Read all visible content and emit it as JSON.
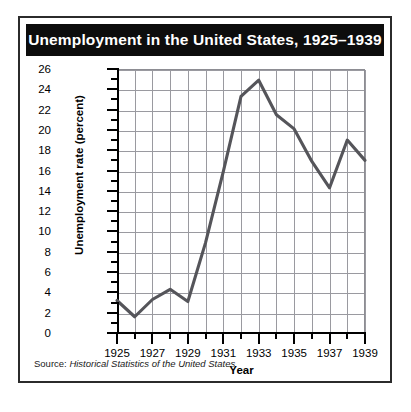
{
  "figure": {
    "title": "Unemployment in the United States, 1925–1939",
    "source_prefix": "Source: ",
    "source_italic": "Historical Statistics of the United States"
  },
  "chart_data": {
    "type": "line",
    "title": "Unemployment in the United States, 1925–1939",
    "xlabel": "Year",
    "ylabel": "Unemployment rate (percent)",
    "x": [
      1925,
      1926,
      1927,
      1928,
      1929,
      1930,
      1931,
      1932,
      1933,
      1934,
      1935,
      1936,
      1937,
      1938,
      1939
    ],
    "values": [
      3.2,
      1.6,
      3.3,
      4.3,
      3.1,
      8.9,
      15.9,
      23.3,
      24.9,
      21.5,
      20.1,
      16.9,
      14.3,
      19.0,
      17.0
    ],
    "xlim": [
      1925,
      1939
    ],
    "ylim": [
      0,
      26
    ],
    "ytick_labels": [
      "0",
      "2",
      "4",
      "6",
      "8",
      "10",
      "12",
      "14",
      "16",
      "18",
      "20",
      "22",
      "24",
      "26"
    ],
    "ytick_values": [
      0,
      2,
      4,
      6,
      8,
      10,
      12,
      14,
      16,
      18,
      20,
      22,
      24,
      26
    ],
    "yminor_values": [
      1,
      3,
      5,
      7,
      9,
      11,
      13,
      15,
      17,
      19,
      21,
      23,
      25
    ],
    "xtick_labels": [
      "1925",
      "1927",
      "1929",
      "1931",
      "1933",
      "1935",
      "1937",
      "1939"
    ],
    "xtick_values": [
      1925,
      1927,
      1929,
      1931,
      1933,
      1935,
      1937,
      1939
    ],
    "xminor_values": [
      1926,
      1928,
      1930,
      1932,
      1934,
      1936,
      1938
    ],
    "grid": true,
    "legend": "none",
    "line_color": "#55555a",
    "grid_color": "#9a9aa0",
    "title_bg_color": "#0d0d0d",
    "title_text_color": "#ffffff"
  }
}
